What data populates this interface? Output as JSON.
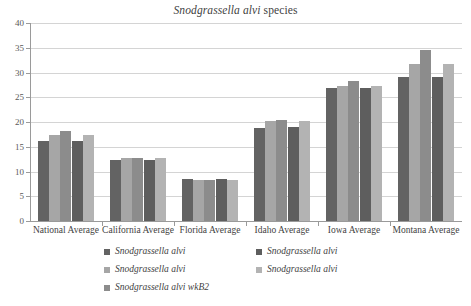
{
  "chart_data": {
    "type": "bar",
    "title_italic_part": "Snodgrassella alvi",
    "title_plain_part": "species",
    "xlabel": "",
    "ylabel": "",
    "ylim": [
      0,
      40
    ],
    "yticks": [
      0,
      5,
      10,
      15,
      20,
      25,
      30,
      35,
      40
    ],
    "grid": true,
    "legend_position": "bottom",
    "categories": [
      "National Average",
      "California Average",
      "Florida Average",
      "Idaho Average",
      "Iowa Average",
      "Montana Average"
    ],
    "series": [
      {
        "name": "Snodgrassella alvi",
        "color": "#636363",
        "values": [
          16.2,
          12.3,
          8.4,
          18.8,
          26.8,
          29.0
        ]
      },
      {
        "name": "Snodgrassella alvi",
        "color": "#a6a6a6",
        "values": [
          17.4,
          12.7,
          8.2,
          20.2,
          27.2,
          31.8
        ]
      },
      {
        "name": "Snodgrassella alvi wkB2",
        "color": "#8c8c8c",
        "values": [
          18.1,
          12.8,
          8.3,
          20.5,
          28.2,
          34.6
        ]
      },
      {
        "name": "Snodgrassella alvi",
        "color": "#5e5e5e",
        "values": [
          16.2,
          12.4,
          8.4,
          18.9,
          26.9,
          29.0
        ]
      },
      {
        "name": "Snodgrassella alvi",
        "color": "#b3b3b3",
        "values": [
          17.4,
          12.7,
          8.2,
          20.2,
          27.2,
          31.8
        ]
      }
    ]
  },
  "legend": {
    "items": [
      {
        "label": "Snodgrassella alvi",
        "color": "#636363"
      },
      {
        "label": "Snodgrassella alvi",
        "color": "#a6a6a6"
      },
      {
        "label": "Snodgrassella alvi wkB2",
        "color": "#8c8c8c"
      },
      {
        "label": "Snodgrassella alvi",
        "color": "#5e5e5e"
      },
      {
        "label": "Snodgrassella alvi",
        "color": "#b3b3b3"
      }
    ],
    "left_column_indices": [
      0,
      1,
      2
    ],
    "right_column_indices": [
      3,
      4
    ]
  },
  "colors": {
    "gridline": "#d4d4d4",
    "axis": "#9a9a9a",
    "text": "#3f3f3f",
    "background": "#ffffff"
  }
}
